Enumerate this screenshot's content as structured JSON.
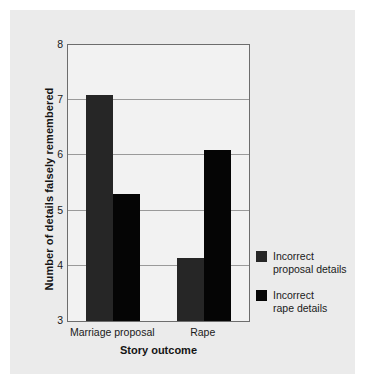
{
  "chart_data": {
    "type": "bar",
    "title": "",
    "categories": [
      "Marriage proposal",
      "Rape"
    ],
    "series": [
      {
        "name": "Incorrect proposal details",
        "values": [
          7.1,
          4.15
        ],
        "color": "#262626"
      },
      {
        "name": "Incorrect rape details",
        "values": [
          5.3,
          6.1
        ],
        "color": "#050505"
      }
    ],
    "xlabel": "Story outcome",
    "ylabel": "Number of details falsely remembered",
    "ylim": [
      3,
      8
    ],
    "yticks": [
      3,
      4,
      5,
      6,
      7,
      8
    ],
    "ytick_labels": [
      "3",
      "4",
      "5",
      "6",
      "7",
      "8"
    ],
    "grid": "horizontal",
    "legend_position": "right"
  },
  "legend": {
    "entries": [
      {
        "line1": "Incorrect",
        "line2": "proposal details"
      },
      {
        "line1": "Incorrect",
        "line2": "rape details"
      }
    ]
  },
  "colors": {
    "figure_background": "#ebebeb",
    "plot_background": "#f2f2f2",
    "axis": "#6d6d6d",
    "gridline": "#9a9a9a",
    "series1": "#262626",
    "series2": "#050505",
    "text": "#1a1a1a"
  }
}
